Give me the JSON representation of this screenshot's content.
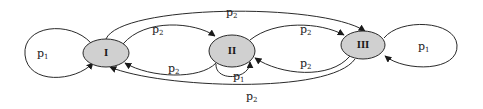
{
  "diagram": {
    "type": "state-transition",
    "nodes": [
      {
        "id": "I",
        "label": "I"
      },
      {
        "id": "II",
        "label": "II"
      },
      {
        "id": "III",
        "label": "III"
      }
    ],
    "edges": [
      {
        "from": "I",
        "to": "I",
        "label": "p",
        "sub": "1"
      },
      {
        "from": "I",
        "to": "II",
        "label": "p",
        "sub": "2"
      },
      {
        "from": "I",
        "to": "III",
        "label": "p",
        "sub": "2"
      },
      {
        "from": "II",
        "to": "I",
        "label": "p",
        "sub": "2"
      },
      {
        "from": "II",
        "to": "II",
        "label": "p",
        "sub": "1"
      },
      {
        "from": "II",
        "to": "III",
        "label": "p",
        "sub": "2"
      },
      {
        "from": "III",
        "to": "II",
        "label": "p",
        "sub": "2"
      },
      {
        "from": "III",
        "to": "I",
        "label": "p",
        "sub": "2"
      },
      {
        "from": "III",
        "to": "III",
        "label": "p",
        "sub": "1"
      }
    ]
  }
}
